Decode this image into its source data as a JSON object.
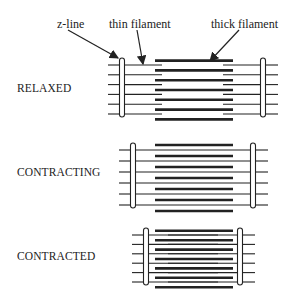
{
  "labels": {
    "z_line": "z-line",
    "thin_filament": "thin filament",
    "thick_filament": "thick filament"
  },
  "states": [
    {
      "name": "RELAXED",
      "zl": 122,
      "zr": 263,
      "top": 58,
      "bottom": 117
    },
    {
      "name": "CONTRACTING",
      "zl": 133,
      "zr": 253,
      "top": 143,
      "bottom": 208
    },
    {
      "name": "CONTRACTED",
      "zl": 146,
      "zr": 240,
      "top": 228,
      "bottom": 285
    }
  ],
  "thick_filament_span": [
    155,
    233
  ],
  "colors": {
    "ink": "#222222",
    "background": "#ffffff"
  }
}
